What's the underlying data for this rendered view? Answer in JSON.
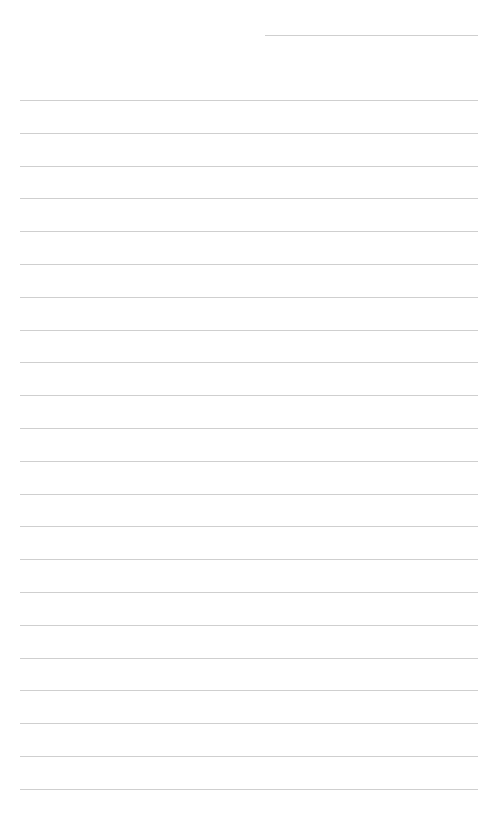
{
  "page": {
    "type": "ruled-notepaper",
    "background": "#ffffff",
    "line_color": "#cfcfcf",
    "header_line": {
      "label": "",
      "x": 265,
      "y": 35,
      "width": 213
    },
    "rules": {
      "count": 22,
      "start_y": 100,
      "spacing": 32.8,
      "x": 20,
      "width": 458
    },
    "lines": [
      "",
      "",
      "",
      "",
      "",
      "",
      "",
      "",
      "",
      "",
      "",
      "",
      "",
      "",
      "",
      "",
      "",
      "",
      "",
      "",
      "",
      ""
    ]
  }
}
